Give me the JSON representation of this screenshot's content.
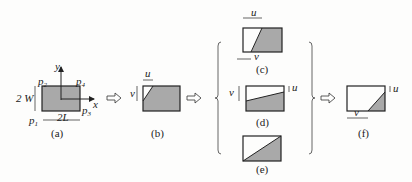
{
  "figure": {
    "panels": [
      {
        "id": "a",
        "caption": "(a)",
        "labels": {
          "y": "y",
          "x": "x",
          "p1": "p",
          "p1_sub": "1",
          "p2": "p",
          "p2_sub": "2",
          "p3": "p",
          "p3_sub": "3",
          "p4": "p",
          "p4_sub": "4",
          "height": "2 W",
          "width": "2L"
        }
      },
      {
        "id": "b",
        "caption": "(b)",
        "labels": {
          "u": "u",
          "v": "v"
        }
      },
      {
        "id": "c",
        "caption": "(c)",
        "labels": {
          "u": "u",
          "v": "v"
        }
      },
      {
        "id": "d",
        "caption": "(d)",
        "labels": {
          "u": "u",
          "v": "v"
        }
      },
      {
        "id": "e",
        "caption": "(e)",
        "labels": {}
      },
      {
        "id": "f",
        "caption": "(f)",
        "labels": {
          "u": "u",
          "v": "v"
        }
      }
    ],
    "colors": {
      "fill": "#a9a9a9",
      "stroke": "#222222",
      "background": "#fdfdfc"
    }
  }
}
